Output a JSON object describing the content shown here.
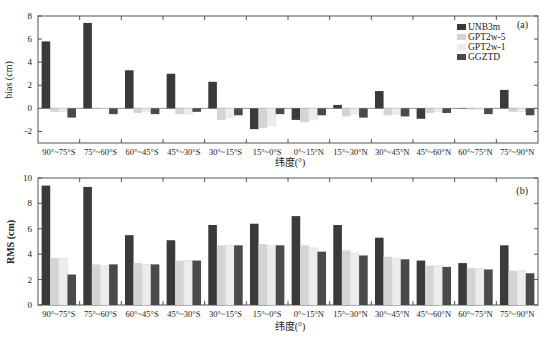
{
  "chart_data": [
    {
      "type": "bar",
      "panel": "(a)",
      "title": "",
      "xlabel": "纬度(°)",
      "ylabel": "bias (cm)",
      "ylim": [
        -3,
        8
      ],
      "yticks": [
        -2,
        0,
        2,
        4,
        6,
        8
      ],
      "grid": false,
      "legend_position": "upper right",
      "categories": [
        "90°~75°S",
        "75°~60°S",
        "60°~45°S",
        "45°~30°S",
        "30°~15°S",
        "15°~0°S",
        "0°~15°N",
        "15°~30°N",
        "30°~45°N",
        "45°~60°N",
        "60°~75°N",
        "75°~90°N"
      ],
      "series": [
        {
          "name": "UNB3m",
          "color": "#3a3a3a",
          "values": [
            5.8,
            7.4,
            3.3,
            3.0,
            2.3,
            -1.8,
            -1.0,
            0.3,
            1.5,
            -0.9,
            0.0,
            1.6
          ]
        },
        {
          "name": "GPT2w-5",
          "color": "#d4d4d4",
          "values": [
            -0.3,
            0.0,
            -0.4,
            -0.5,
            -1.0,
            -1.7,
            -1.2,
            -0.7,
            -0.6,
            -0.4,
            -0.1,
            -0.3
          ]
        },
        {
          "name": "GPT2w-1",
          "color": "#ececec",
          "values": [
            -0.3,
            0.0,
            -0.3,
            -0.5,
            -0.8,
            -1.5,
            -1.0,
            -0.5,
            -0.5,
            -0.3,
            -0.1,
            -0.3
          ]
        },
        {
          "name": "GGZTD",
          "color": "#4a4a4a",
          "values": [
            -0.8,
            -0.5,
            -0.5,
            -0.3,
            -0.6,
            -0.5,
            -0.6,
            -0.8,
            -0.7,
            -0.4,
            -0.5,
            -0.6
          ]
        }
      ]
    },
    {
      "type": "bar",
      "panel": "(b)",
      "title": "",
      "xlabel": "纬度(°)",
      "ylabel": "RMS (cm)",
      "ylim": [
        0,
        10
      ],
      "yticks": [
        0,
        2,
        4,
        6,
        8,
        10
      ],
      "grid": false,
      "categories": [
        "90°~75°S",
        "75°~60°S",
        "60°~45°S",
        "45°~30°S",
        "30°~15°S",
        "15°~0°S",
        "0°~15°N",
        "15°~30°N",
        "30°~45°N",
        "45°~60°N",
        "60°~75°N",
        "75°~90°N"
      ],
      "series": [
        {
          "name": "UNB3m",
          "color": "#3a3a3a",
          "values": [
            9.4,
            9.3,
            5.5,
            5.1,
            6.3,
            6.4,
            7.0,
            6.3,
            5.3,
            3.5,
            3.3,
            4.7
          ]
        },
        {
          "name": "GPT2w-5",
          "color": "#d4d4d4",
          "values": [
            3.7,
            3.2,
            3.3,
            3.5,
            4.7,
            4.8,
            4.7,
            4.3,
            3.8,
            3.1,
            2.9,
            2.7
          ]
        },
        {
          "name": "GPT2w-1",
          "color": "#ececec",
          "values": [
            3.7,
            3.1,
            3.2,
            3.5,
            4.7,
            4.7,
            4.5,
            4.1,
            3.7,
            3.1,
            2.9,
            2.7
          ]
        },
        {
          "name": "GGZTD",
          "color": "#4a4a4a",
          "values": [
            2.4,
            3.2,
            3.2,
            3.5,
            4.7,
            4.7,
            4.2,
            3.9,
            3.6,
            3.0,
            2.8,
            2.5
          ]
        }
      ]
    }
  ],
  "panels": {
    "a": {
      "tag": "(a)",
      "ylabel": "bias (cm)",
      "xlabel": "纬度(°)"
    },
    "b": {
      "tag": "(b)",
      "ylabel": "RMS (cm)",
      "xlabel": "纬度(°)"
    }
  },
  "legend": [
    "UNB3m",
    "GPT2w-5",
    "GPT2w-1",
    "GGZTD"
  ]
}
